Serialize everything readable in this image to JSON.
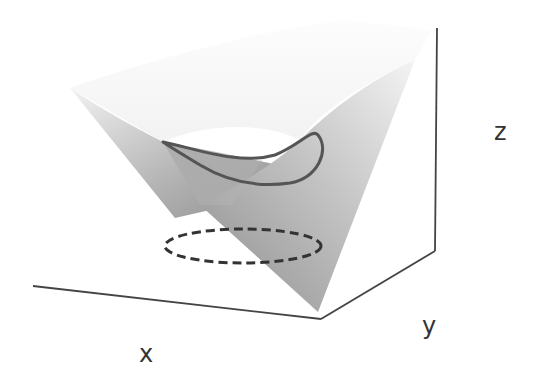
{
  "diagram": {
    "type": "3d-surface-sketch",
    "axes": {
      "x_label": "x",
      "y_label": "y",
      "z_label": "z"
    },
    "elements": [
      {
        "name": "saddle-surface",
        "style": "gray gradient fill"
      },
      {
        "name": "curve-on-surface",
        "style": "solid dark loop"
      },
      {
        "name": "projected-curve",
        "style": "dashed ellipse on base plane"
      },
      {
        "name": "bounding-box-edges",
        "style": "thin dark lines"
      }
    ],
    "colors": {
      "axis_line": "#444444",
      "surface_light": "#d8d8d8",
      "surface_mid": "#a9a9a9",
      "surface_dark": "#8a8a8a",
      "curve": "#555555",
      "dashed": "#333333",
      "label": "#333333"
    }
  }
}
